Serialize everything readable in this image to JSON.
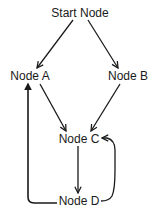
{
  "diagram": {
    "type": "directed-graph",
    "nodes": [
      {
        "id": "start",
        "label": "Start Node",
        "x": 80,
        "y": 13
      },
      {
        "id": "a",
        "label": "Node A",
        "x": 30,
        "y": 76
      },
      {
        "id": "b",
        "label": "Node B",
        "x": 128,
        "y": 76
      },
      {
        "id": "c",
        "label": "Node C",
        "x": 79,
        "y": 139
      },
      {
        "id": "d",
        "label": "Node D",
        "x": 79,
        "y": 201
      }
    ],
    "edges": [
      {
        "from": "start",
        "to": "a"
      },
      {
        "from": "start",
        "to": "b"
      },
      {
        "from": "a",
        "to": "c"
      },
      {
        "from": "b",
        "to": "c"
      },
      {
        "from": "c",
        "to": "d"
      },
      {
        "from": "d",
        "to": "c",
        "style": "curved-right"
      },
      {
        "from": "d",
        "to": "a",
        "style": "orthogonal-left"
      }
    ],
    "colors": {
      "edge": "#1a1a1a",
      "text": "#1a1a1a",
      "background": "#ffffff"
    }
  }
}
